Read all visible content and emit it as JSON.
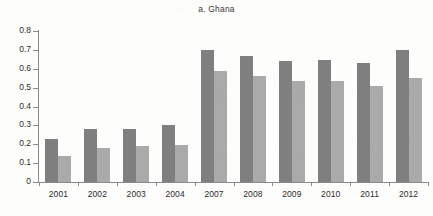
{
  "chart_data": {
    "type": "bar",
    "title": "a. Ghana",
    "xlabel": "",
    "ylabel": "",
    "ylim": [
      0,
      0.8
    ],
    "ytick_values": [
      0,
      0.1,
      0.2,
      0.3,
      0.4,
      0.5,
      0.6,
      0.7,
      0.8
    ],
    "ytick_labels": [
      "0",
      "0.1",
      "0.2",
      "0.3",
      "0.4",
      "0.5",
      "0.6",
      "0.7",
      "0.8"
    ],
    "grid": false,
    "legend": "none",
    "categories": [
      "2001",
      "2002",
      "2003",
      "2004",
      "2007",
      "2008",
      "2009",
      "2010",
      "2011",
      "2012"
    ],
    "series": [
      {
        "name": "series-1",
        "color": "#7f7f7f",
        "values": [
          0.23,
          0.28,
          0.28,
          0.3,
          0.7,
          0.67,
          0.64,
          0.645,
          0.63,
          0.7
        ]
      },
      {
        "name": "series-2",
        "color": "#aaaaaa",
        "values": [
          0.14,
          0.18,
          0.19,
          0.195,
          0.59,
          0.56,
          0.535,
          0.535,
          0.51,
          0.55
        ]
      }
    ]
  },
  "colors": {
    "series_1": "#7f7f7f",
    "series_2": "#aaaaaa",
    "axis": "#8b8b8b",
    "text": "#2b2b2b",
    "background": "#fdfdfb"
  }
}
